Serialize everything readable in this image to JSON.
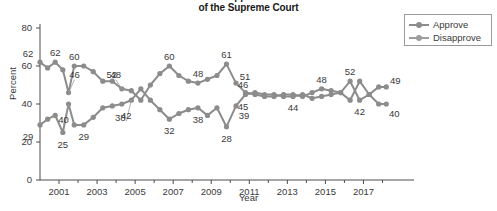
{
  "chart_data": {
    "type": "line",
    "title": "Approval of the Supreme Court",
    "title_line1": "Approval",
    "title_line2": "of the Supreme Court",
    "xlabel": "Year",
    "ylabel": "Percent",
    "ylim": [
      0,
      80
    ],
    "xlim": [
      2000,
      2018.5
    ],
    "ytick_labels": [
      "0",
      "20",
      "40",
      "60",
      "80"
    ],
    "ytick_values": [
      0,
      20,
      40,
      60,
      80
    ],
    "xtick_labels": [
      "2001",
      "2003",
      "2005",
      "2007",
      "2009",
      "2011",
      "2013",
      "2015",
      "2017"
    ],
    "xtick_values": [
      2001,
      2003,
      2005,
      2007,
      2009,
      2011,
      2013,
      2015,
      2017
    ],
    "grid": false,
    "legend_position": "top-right",
    "series": [
      {
        "name": "Approve",
        "color": "#8c8c8c",
        "x": [
          2000.0,
          2000.4,
          2000.8,
          2001.2,
          2001.5,
          2001.8,
          2002.3,
          2002.8,
          2003.3,
          2003.8,
          2004.3,
          2004.8,
          2005.3,
          2005.8,
          2006.3,
          2006.8,
          2007.3,
          2007.8,
          2008.3,
          2008.8,
          2009.3,
          2009.8,
          2010.3,
          2010.8,
          2011.3,
          2011.8,
          2012.3,
          2012.8,
          2013.3,
          2013.8,
          2014.3,
          2014.8,
          2015.3,
          2015.8,
          2016.3,
          2016.8,
          2017.3,
          2017.8,
          2018.2
        ],
        "y": [
          62,
          59,
          62,
          58,
          46,
          60,
          60,
          57,
          52,
          52,
          48,
          47,
          42,
          50,
          56,
          60,
          55,
          52,
          51,
          53,
          55,
          61,
          51,
          46,
          45,
          44,
          44,
          45,
          45,
          44,
          46,
          48,
          47,
          46,
          52,
          42,
          45,
          49,
          49
        ]
      },
      {
        "name": "Disapprove",
        "color": "#8c8c8c",
        "x": [
          2000.0,
          2000.4,
          2000.8,
          2001.2,
          2001.5,
          2001.8,
          2002.3,
          2002.8,
          2003.3,
          2003.8,
          2004.3,
          2004.8,
          2005.3,
          2005.8,
          2006.3,
          2006.8,
          2007.3,
          2007.8,
          2008.3,
          2008.8,
          2009.3,
          2009.8,
          2010.3,
          2010.8,
          2011.3,
          2011.8,
          2012.3,
          2012.8,
          2013.3,
          2013.8,
          2014.3,
          2014.8,
          2015.3,
          2015.8,
          2016.3,
          2016.8,
          2017.3,
          2017.8,
          2018.2
        ],
        "y": [
          29,
          32,
          34,
          25,
          40,
          29,
          29,
          33,
          38,
          39,
          40,
          42,
          48,
          42,
          37,
          32,
          35,
          37,
          38,
          34,
          38,
          28,
          39,
          45,
          46,
          45,
          45,
          44,
          44,
          45,
          43,
          44,
          45,
          46,
          42,
          52,
          45,
          40,
          40
        ]
      }
    ],
    "point_labels": [
      {
        "text": "62",
        "series": "Approve",
        "x": 2000.0,
        "y": 62,
        "pos": "above-left"
      },
      {
        "text": "62",
        "series": "Approve",
        "x": 2000.8,
        "y": 62,
        "pos": "above"
      },
      {
        "text": "46",
        "series": "Approve",
        "x": 2001.5,
        "y": 46,
        "pos": "above-right-leader"
      },
      {
        "text": "60",
        "series": "Approve",
        "x": 2001.8,
        "y": 60,
        "pos": "above"
      },
      {
        "text": "52",
        "series": "Approve",
        "x": 2003.3,
        "y": 52,
        "pos": "above-right"
      },
      {
        "text": "48",
        "series": "Approve",
        "x": 2004.3,
        "y": 48,
        "pos": "above-leader"
      },
      {
        "text": "60",
        "series": "Approve",
        "x": 2006.8,
        "y": 60,
        "pos": "above"
      },
      {
        "text": "48",
        "series": "Approve",
        "x": 2008.3,
        "y": 51,
        "pos": "above"
      },
      {
        "text": "61",
        "series": "Approve",
        "x": 2009.8,
        "y": 61,
        "pos": "above"
      },
      {
        "text": "51",
        "series": "Approve",
        "x": 2010.3,
        "y": 51,
        "pos": "above-right"
      },
      {
        "text": "46",
        "series": "Approve",
        "x": 2011.3,
        "y": 46,
        "pos": "above-left"
      },
      {
        "text": "48",
        "series": "Approve",
        "x": 2014.8,
        "y": 48,
        "pos": "above"
      },
      {
        "text": "52",
        "series": "Approve",
        "x": 2016.3,
        "y": 52,
        "pos": "above"
      },
      {
        "text": "49",
        "series": "Approve",
        "x": 2018.2,
        "y": 49,
        "pos": "above-right"
      },
      {
        "text": "29",
        "series": "Disapprove",
        "x": 2000.0,
        "y": 29,
        "pos": "below-left"
      },
      {
        "text": "25",
        "series": "Disapprove",
        "x": 2001.2,
        "y": 25,
        "pos": "below"
      },
      {
        "text": "40",
        "series": "Disapprove",
        "x": 2001.5,
        "y": 40,
        "pos": "below-leader"
      },
      {
        "text": "29",
        "series": "Disapprove",
        "x": 2002.3,
        "y": 29,
        "pos": "below"
      },
      {
        "text": "38",
        "series": "Disapprove",
        "x": 2003.8,
        "y": 38,
        "pos": "below-right"
      },
      {
        "text": "42",
        "series": "Disapprove",
        "x": 2004.8,
        "y": 42,
        "pos": "below-leader"
      },
      {
        "text": "32",
        "series": "Disapprove",
        "x": 2006.8,
        "y": 32,
        "pos": "below"
      },
      {
        "text": "38",
        "series": "Disapprove",
        "x": 2008.3,
        "y": 38,
        "pos": "below"
      },
      {
        "text": "28",
        "series": "Disapprove",
        "x": 2009.8,
        "y": 28,
        "pos": "below"
      },
      {
        "text": "39",
        "series": "Disapprove",
        "x": 2010.3,
        "y": 39,
        "pos": "below-right"
      },
      {
        "text": "45",
        "series": "Disapprove",
        "x": 2011.3,
        "y": 45,
        "pos": "below-left"
      },
      {
        "text": "44",
        "series": "Disapprove",
        "x": 2013.3,
        "y": 44,
        "pos": "below"
      },
      {
        "text": "42",
        "series": "Disapprove",
        "x": 2016.8,
        "y": 42,
        "pos": "below"
      },
      {
        "text": "40",
        "series": "Disapprove",
        "x": 2018.2,
        "y": 40,
        "pos": "below-right"
      }
    ]
  },
  "legend": {
    "items": [
      {
        "label": "Approve"
      },
      {
        "label": "Disapprove"
      }
    ]
  }
}
